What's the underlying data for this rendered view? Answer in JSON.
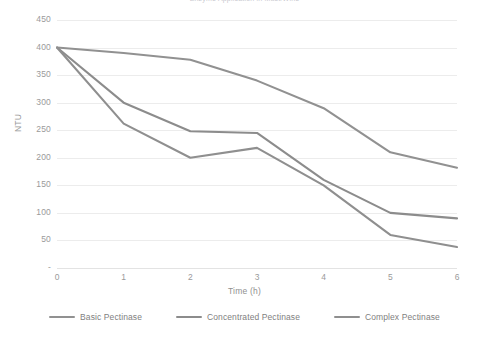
{
  "chart_data": {
    "type": "line",
    "title": "Enzyme Application in Must/Wine",
    "xlabel": "Time (h)",
    "ylabel": "NTU",
    "x": [
      0,
      1,
      2,
      3,
      4,
      5,
      6
    ],
    "xtick_labels": [
      "0",
      "1",
      "2",
      "3",
      "4",
      "5",
      "6"
    ],
    "ytick_labels": [
      "450",
      "400",
      "350",
      "300",
      "250",
      "200",
      "150",
      "100",
      "50",
      "-"
    ],
    "yticks": [
      450,
      400,
      350,
      300,
      250,
      200,
      150,
      100,
      50,
      0
    ],
    "xlim": [
      0,
      6
    ],
    "ylim": [
      0,
      450
    ],
    "grid": true,
    "legend_position": "bottom",
    "series": [
      {
        "name": "Basic Pectinase",
        "color": "#919191",
        "values": [
          400,
          390,
          378,
          340,
          290,
          210,
          182
        ]
      },
      {
        "name": "Concentrated Pectinase",
        "color": "#8c8c8c",
        "values": [
          400,
          300,
          248,
          245,
          160,
          100,
          90
        ]
      },
      {
        "name": "Complex Pectinase",
        "color": "#8f8f8f",
        "values": [
          400,
          262,
          200,
          218,
          150,
          60,
          38
        ]
      }
    ]
  },
  "axes": {
    "y_title": "NTU",
    "x_title": "Time (h)"
  }
}
